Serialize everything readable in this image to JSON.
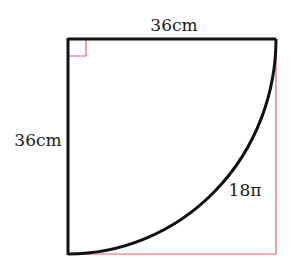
{
  "diagram": {
    "type": "quarter-circle-in-square",
    "top_side_label": "36cm",
    "left_side_label": "36cm",
    "arc_label": "18π",
    "colors": {
      "main_stroke": "#111111",
      "guide_stroke": "#e06060",
      "background": "#ffffff"
    },
    "right_angle_marker": true
  }
}
